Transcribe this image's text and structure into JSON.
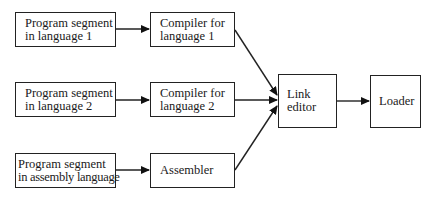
{
  "diagram": {
    "type": "flowchart",
    "nodes": [
      {
        "id": "seg1",
        "lines": [
          "Program segment",
          "in language 1"
        ]
      },
      {
        "id": "seg2",
        "lines": [
          "Program segment",
          "in language 2"
        ]
      },
      {
        "id": "seg3",
        "lines": [
          "Program segment",
          "in assembly language"
        ]
      },
      {
        "id": "comp1",
        "lines": [
          "Compiler for",
          "language 1"
        ]
      },
      {
        "id": "comp2",
        "lines": [
          "Compiler for",
          "language 2"
        ]
      },
      {
        "id": "asm",
        "lines": [
          "Assembler"
        ]
      },
      {
        "id": "link",
        "lines": [
          "Link",
          "editor"
        ]
      },
      {
        "id": "loader",
        "lines": [
          "Loader"
        ]
      }
    ],
    "edges": [
      {
        "from": "seg1",
        "to": "comp1"
      },
      {
        "from": "seg2",
        "to": "comp2"
      },
      {
        "from": "seg3",
        "to": "asm"
      },
      {
        "from": "comp1",
        "to": "link"
      },
      {
        "from": "comp2",
        "to": "link"
      },
      {
        "from": "asm",
        "to": "link"
      },
      {
        "from": "link",
        "to": "loader"
      }
    ]
  }
}
